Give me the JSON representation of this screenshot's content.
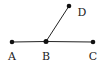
{
  "diagram": {
    "points": [
      {
        "id": "A",
        "label": "A",
        "x": 12,
        "y": 42,
        "lx": 12,
        "ly": 58
      },
      {
        "id": "B",
        "label": "B",
        "x": 46,
        "y": 41,
        "lx": 46,
        "ly": 58
      },
      {
        "id": "C",
        "label": "C",
        "x": 93,
        "y": 42,
        "lx": 93,
        "ly": 58
      },
      {
        "id": "D",
        "label": "D",
        "x": 69,
        "y": 6,
        "lx": 82,
        "ly": 15
      }
    ],
    "segments": [
      [
        "A",
        "B"
      ],
      [
        "B",
        "C"
      ],
      [
        "B",
        "D"
      ]
    ],
    "colors": {
      "line": "#222222",
      "dot": "#111111"
    }
  }
}
